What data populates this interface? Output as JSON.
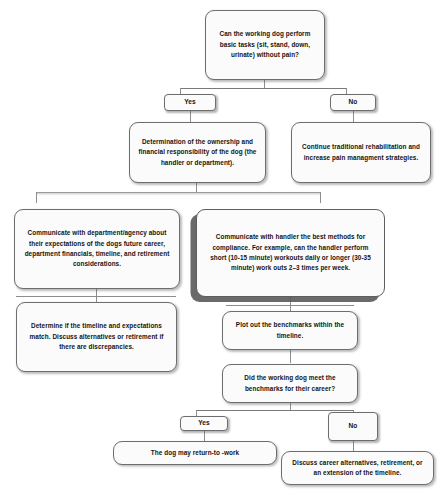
{
  "diagram": {
    "background_color": "#ffffff",
    "node_fill": "#fbfbfb",
    "node_border": "#6d6d6d",
    "connector_color": "#8d8d8d",
    "type": "flowchart"
  },
  "nodes": {
    "q_basic_tasks": "Can the working dog perform basic tasks (sit, stand, down, urinate) without pain?",
    "label_yes_1": "Yes",
    "label_no_1": "No",
    "ownership": "Determination of the ownership and financial responsibility of the dog (the handler or department).",
    "rehab": "Continue traditional rehabilitation and increase pain managment strategies.",
    "communicate_department": "Communicate with department/agency  about their expectations of the dogs future career, department financials, timeline, and retirement considerations.",
    "communicate_handler": "Communicate with handler the best methods for compliance. For example, can the handler perform short (10-15 minute) workouts daily or longer (30-35 minute) work outs 2–3 times per week.",
    "timeline_match": "Determine if the timeline and expectations match. Discuss alternatives or retirement if there are discrepancies.",
    "plot_benchmarks": "Plot out the benchmarks within the timeline.",
    "q_met_benchmarks": "Did the working dog meet the benchmarks for their career?",
    "label_yes_2": "Yes",
    "label_no_2": "No",
    "return_to_work": "The dog may return-to -work",
    "discuss_alternatives": "Discuss career alternatives, retirement, or an extension of the timeline."
  }
}
